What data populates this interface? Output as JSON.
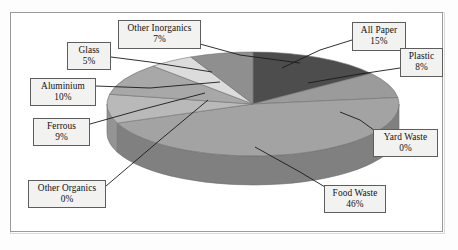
{
  "figure": {
    "background_color": "#ffffff",
    "frame_color": "#9a9a9a"
  },
  "chart_data": {
    "type": "pie",
    "title": "",
    "subtitle": "",
    "xlabel": "",
    "ylabel": "",
    "legend_position": "none",
    "grid": false,
    "three_d": true,
    "start_angle_deg": 0,
    "direction": "clockwise",
    "categories": [
      "All Paper",
      "Plastic",
      "Yard Waste",
      "Food Waste",
      "Other Organics",
      "Ferrous",
      "Aluminium",
      "Glass",
      "Other Inorganics"
    ],
    "values": [
      15,
      8,
      0,
      46,
      0,
      9,
      10,
      5,
      7
    ],
    "value_suffix": "%",
    "slice_colors": [
      "#4d4d4d",
      "#9b9b9b",
      "#8e8e8e",
      "#a3a3a3",
      "#b4b4b4",
      "#b9b9b9",
      "#a8a8a8",
      "#dcdcdc",
      "#8f8f8f"
    ],
    "side_colors": [
      "#3a3a3a",
      "#7a7a7a",
      "#6f6f6f",
      "#808080",
      "#909090",
      "#949494",
      "#868686",
      "#b0b0b0",
      "#717171"
    ]
  },
  "labels": [
    {
      "name": "glass",
      "line1": "Glass",
      "line2": "5%"
    },
    {
      "name": "other-inorganics",
      "line1": "Other Inorganics",
      "line2": "7%"
    },
    {
      "name": "aluminium",
      "line1": "Aluminium",
      "line2": "10%"
    },
    {
      "name": "ferrous",
      "line1": "Ferrous",
      "line2": "9%"
    },
    {
      "name": "other-organics",
      "line1": "Other Organics",
      "line2": "0%"
    },
    {
      "name": "all-paper",
      "line1": "All Paper",
      "line2": "15%"
    },
    {
      "name": "plastic",
      "line1": "Plastic",
      "line2": "8%"
    },
    {
      "name": "yard-waste",
      "line1": "Yard Waste",
      "line2": "0%"
    },
    {
      "name": "food-waste",
      "line1": "Food Waste",
      "line2": "46%"
    }
  ]
}
